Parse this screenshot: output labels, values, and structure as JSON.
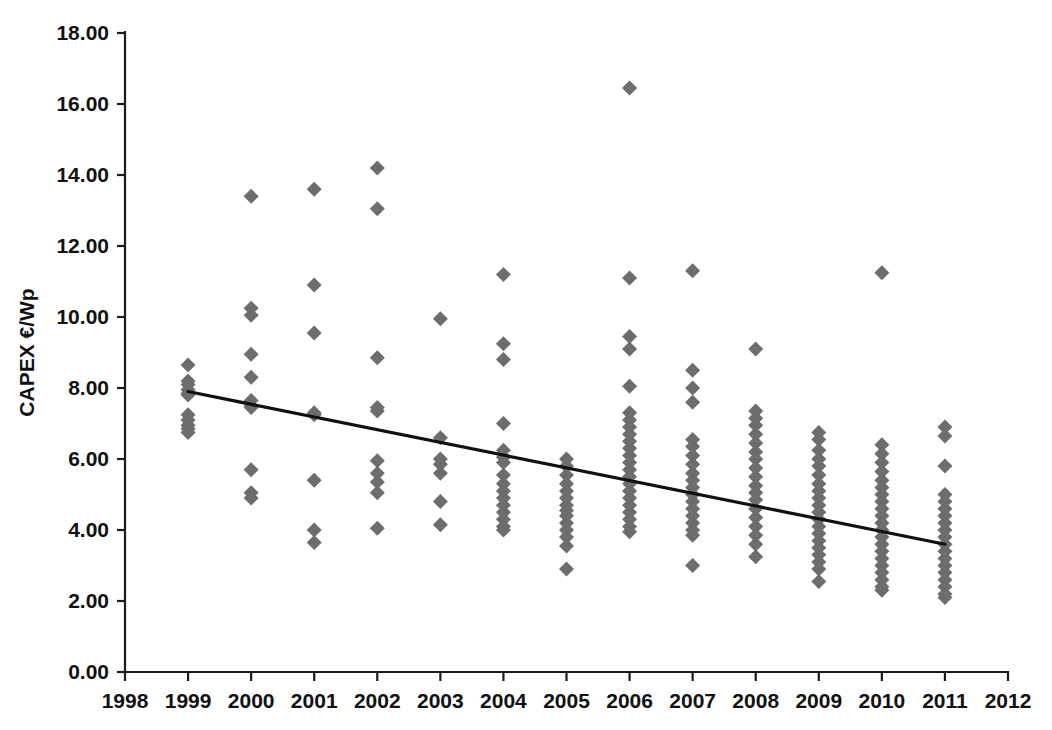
{
  "chart_data": {
    "type": "scatter",
    "title": "",
    "xlabel": "",
    "ylabel": "CAPEX €/Wp",
    "xlim": [
      1998,
      2012
    ],
    "ylim": [
      0,
      18
    ],
    "grid": false,
    "legend": null,
    "x_ticks": [
      1998,
      1999,
      2000,
      2001,
      2002,
      2003,
      2004,
      2005,
      2006,
      2007,
      2008,
      2009,
      2010,
      2011,
      2012
    ],
    "x_tick_labels": [
      "1998",
      "1999",
      "2000",
      "2001",
      "2002",
      "2003",
      "2004",
      "2005",
      "2006",
      "2007",
      "2008",
      "2009",
      "2010",
      "2011",
      "2012"
    ],
    "y_ticks": [
      0,
      2,
      4,
      6,
      8,
      10,
      12,
      14,
      16,
      18
    ],
    "y_tick_labels": [
      "0.00",
      "2.00",
      "4.00",
      "6.00",
      "8.00",
      "10.00",
      "12.00",
      "14.00",
      "16.00",
      "18.00"
    ],
    "marker": "diamond",
    "marker_color": "#6d6d6d",
    "trend_color": "#111111",
    "axis_color": "#1a1a1a",
    "background_color": "#ffffff",
    "series": [
      {
        "name": "CAPEX observations",
        "points_by_year": [
          {
            "x": 1999,
            "y": [
              8.65,
              8.2,
              8.1,
              7.95,
              7.85,
              7.8,
              7.25,
              7.1,
              6.95,
              6.85,
              6.75
            ]
          },
          {
            "x": 2000,
            "y": [
              13.4,
              10.25,
              10.05,
              8.95,
              8.3,
              7.65,
              7.5,
              7.45,
              5.7,
              5.05,
              4.9
            ]
          },
          {
            "x": 2001,
            "y": [
              13.6,
              10.9,
              9.55,
              7.3,
              7.25,
              5.4,
              4.0,
              3.65
            ]
          },
          {
            "x": 2002,
            "y": [
              14.2,
              13.05,
              8.85,
              7.45,
              7.35,
              5.95,
              5.6,
              5.35,
              5.05,
              4.05
            ]
          },
          {
            "x": 2003,
            "y": [
              9.95,
              6.6,
              6.0,
              5.85,
              5.6,
              4.8,
              4.15
            ]
          },
          {
            "x": 2004,
            "y": [
              11.2,
              9.25,
              8.8,
              7.0,
              6.25,
              6.05,
              5.9,
              5.55,
              5.3,
              5.1,
              4.9,
              4.7,
              4.5,
              4.3,
              4.1,
              4.0
            ]
          },
          {
            "x": 2005,
            "y": [
              6.0,
              5.8,
              5.55,
              5.3,
              5.1,
              4.9,
              4.7,
              4.55,
              4.4,
              4.2,
              4.0,
              3.8,
              3.55,
              2.9
            ]
          },
          {
            "x": 2006,
            "y": [
              16.45,
              11.1,
              9.45,
              9.1,
              8.05,
              7.3,
              7.1,
              6.9,
              6.7,
              6.5,
              6.3,
              6.1,
              5.9,
              5.7,
              5.5,
              5.3,
              5.1,
              4.9,
              4.7,
              4.5,
              4.3,
              4.1,
              3.95
            ]
          },
          {
            "x": 2007,
            "y": [
              11.3,
              8.5,
              8.0,
              7.6,
              6.55,
              6.35,
              6.1,
              5.85,
              5.6,
              5.4,
              5.2,
              5.0,
              4.8,
              4.6,
              4.4,
              4.2,
              4.0,
              3.85,
              3.0
            ]
          },
          {
            "x": 2008,
            "y": [
              9.1,
              7.35,
              7.15,
              6.95,
              6.7,
              6.45,
              6.2,
              6.0,
              5.75,
              5.5,
              5.25,
              5.05,
              4.85,
              4.6,
              4.35,
              4.1,
              3.85,
              3.6,
              3.25
            ]
          },
          {
            "x": 2009,
            "y": [
              6.75,
              6.55,
              6.25,
              6.0,
              5.8,
              5.55,
              5.3,
              5.1,
              4.9,
              4.7,
              4.5,
              4.3,
              4.1,
              3.9,
              3.7,
              3.5,
              3.3,
              3.1,
              2.9,
              2.55
            ]
          },
          {
            "x": 2010,
            "y": [
              11.25,
              6.4,
              6.15,
              5.9,
              5.65,
              5.4,
              5.2,
              5.0,
              4.8,
              4.6,
              4.4,
              4.2,
              4.0,
              3.8,
              3.6,
              3.4,
              3.2,
              3.0,
              2.8,
              2.6,
              2.4,
              2.3
            ]
          },
          {
            "x": 2011,
            "y": [
              6.9,
              6.65,
              5.8,
              5.0,
              4.8,
              4.6,
              4.4,
              4.2,
              4.0,
              3.8,
              3.6,
              3.4,
              3.2,
              3.0,
              2.8,
              2.6,
              2.4,
              2.2,
              2.1
            ]
          }
        ]
      }
    ],
    "trendline": {
      "name": "linear fit",
      "x_start": 1999,
      "y_start": 7.9,
      "x_end": 2011,
      "y_end": 3.6
    }
  }
}
